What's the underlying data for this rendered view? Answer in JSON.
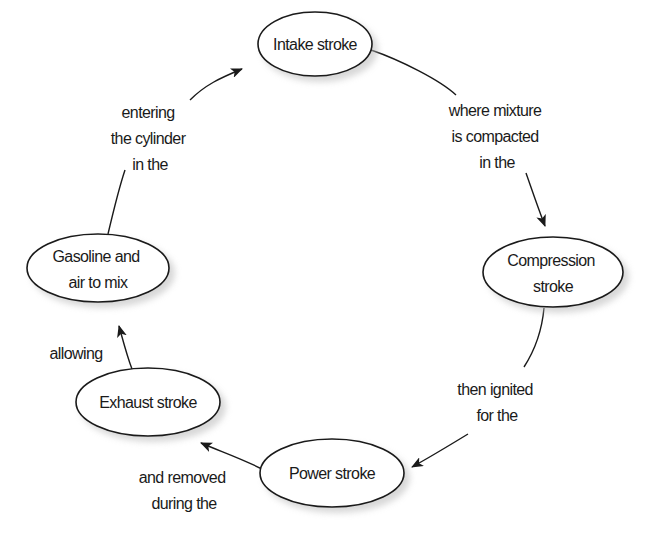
{
  "diagram": {
    "colors": {
      "stroke": "#1a1a1a",
      "fill": "#ffffff",
      "shadow": "#b8b8b8",
      "background": "#ffffff"
    },
    "nodes": [
      {
        "id": "intake",
        "lines": [
          "Intake stroke"
        ]
      },
      {
        "id": "compression",
        "lines": [
          "Compression",
          "stroke"
        ]
      },
      {
        "id": "power",
        "lines": [
          "Power stroke"
        ]
      },
      {
        "id": "exhaust",
        "lines": [
          "Exhaust stroke"
        ]
      },
      {
        "id": "gasoline",
        "lines": [
          "Gasoline and",
          "air to mix"
        ]
      }
    ],
    "edges": [
      {
        "from": "intake",
        "to": "compression",
        "lines": [
          "where mixture",
          "is compacted",
          "in the"
        ]
      },
      {
        "from": "compression",
        "to": "power",
        "lines": [
          "then ignited",
          "for the"
        ]
      },
      {
        "from": "power",
        "to": "exhaust",
        "lines": [
          "and removed",
          "during the"
        ]
      },
      {
        "from": "exhaust",
        "to": "gasoline",
        "lines": [
          "allowing"
        ]
      },
      {
        "from": "gasoline",
        "to": "intake",
        "lines": [
          "entering",
          "the cylinder",
          "in the"
        ]
      }
    ]
  }
}
